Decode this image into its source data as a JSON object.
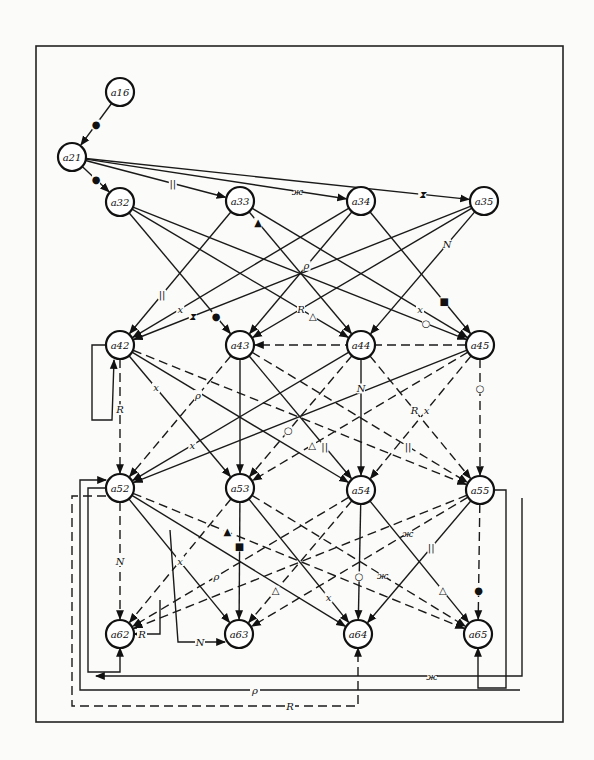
{
  "diagram": {
    "type": "directed-graph",
    "frame": {
      "x": 36,
      "y": 46,
      "w": 527,
      "h": 676
    },
    "nodes": [
      {
        "id": "a16",
        "label": "a16",
        "x": 120,
        "y": 92
      },
      {
        "id": "a21",
        "label": "a21",
        "x": 72,
        "y": 157
      },
      {
        "id": "a32",
        "label": "a32",
        "x": 120,
        "y": 202
      },
      {
        "id": "a33",
        "label": "a33",
        "x": 240,
        "y": 201
      },
      {
        "id": "a34",
        "label": "a34",
        "x": 361,
        "y": 201
      },
      {
        "id": "a35",
        "label": "a35",
        "x": 484,
        "y": 201
      },
      {
        "id": "a42",
        "label": "a42",
        "x": 120,
        "y": 345
      },
      {
        "id": "a43",
        "label": "a43",
        "x": 240,
        "y": 345
      },
      {
        "id": "a44",
        "label": "a44",
        "x": 361,
        "y": 345
      },
      {
        "id": "a45",
        "label": "a45",
        "x": 480,
        "y": 345
      },
      {
        "id": "a52",
        "label": "a52",
        "x": 120,
        "y": 488
      },
      {
        "id": "a53",
        "label": "a53",
        "x": 240,
        "y": 488
      },
      {
        "id": "a54",
        "label": "a54",
        "x": 361,
        "y": 490
      },
      {
        "id": "a55",
        "label": "a55",
        "x": 480,
        "y": 490
      },
      {
        "id": "a62",
        "label": "a62",
        "x": 120,
        "y": 634
      },
      {
        "id": "a63",
        "label": "a63",
        "x": 239,
        "y": 634
      },
      {
        "id": "a64",
        "label": "a64",
        "x": 358,
        "y": 634
      },
      {
        "id": "a65",
        "label": "a65",
        "x": 478,
        "y": 634
      }
    ],
    "edge_markers": [
      "●",
      "||",
      "ж",
      "⧗",
      "▲",
      "△",
      "○",
      "N",
      "R",
      "ρ",
      "х",
      "■"
    ],
    "bottom_labels": {
      "star": "ж",
      "rho": "ρ",
      "r": "R"
    },
    "r_label_a62": "R",
    "n_label_a63": "N"
  }
}
